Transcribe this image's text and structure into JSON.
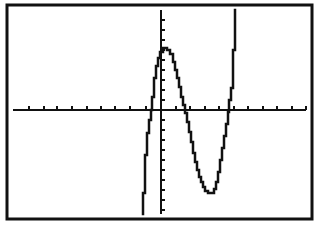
{
  "screen": {
    "background": "#ffffff",
    "ink": "#111111"
  },
  "frame": {
    "x": 7,
    "y": 5,
    "width": 305,
    "height": 214,
    "stroke_width": 3
  },
  "axes": {
    "x_axis": {
      "y": 110,
      "x_start": 13,
      "x_end": 306
    },
    "y_axis": {
      "x": 161,
      "y_start": 10,
      "y_end": 214
    },
    "x_tick_pixel_positions": [
      29,
      44,
      57,
      72,
      87,
      101,
      115,
      130,
      146,
      161,
      176,
      190,
      205,
      219,
      234,
      248,
      263,
      277,
      292,
      306
    ],
    "y_tick_pixel_positions": [
      20,
      30,
      40,
      50,
      60,
      70,
      80,
      90,
      100,
      120,
      130,
      140,
      150,
      160,
      170,
      180,
      190,
      200,
      210
    ],
    "tick_length": 4
  },
  "chart_data": {
    "type": "line",
    "title": "",
    "xlabel": "",
    "ylabel": "",
    "grid": false,
    "legend": null,
    "axis_labels_shown": false,
    "series": [
      {
        "name": "Y1",
        "style": "pixelated-step",
        "points_px": [
          [
            143,
            214
          ],
          [
            143,
            193
          ],
          [
            145,
            193
          ],
          [
            145,
            155
          ],
          [
            147,
            155
          ],
          [
            147,
            133
          ],
          [
            149,
            133
          ],
          [
            149,
            120
          ],
          [
            151,
            120
          ],
          [
            151,
            110
          ],
          [
            152,
            110
          ],
          [
            152,
            97
          ],
          [
            154,
            97
          ],
          [
            154,
            78
          ],
          [
            156,
            78
          ],
          [
            156,
            66
          ],
          [
            158,
            66
          ],
          [
            158,
            58
          ],
          [
            160,
            58
          ],
          [
            160,
            52
          ],
          [
            163,
            52
          ],
          [
            163,
            48
          ],
          [
            167,
            48
          ],
          [
            167,
            50
          ],
          [
            170,
            50
          ],
          [
            170,
            54
          ],
          [
            173,
            54
          ],
          [
            173,
            62
          ],
          [
            175,
            62
          ],
          [
            175,
            70
          ],
          [
            177,
            70
          ],
          [
            177,
            78
          ],
          [
            179,
            78
          ],
          [
            179,
            87
          ],
          [
            181,
            87
          ],
          [
            181,
            97
          ],
          [
            183,
            97
          ],
          [
            183,
            105
          ],
          [
            185,
            105
          ],
          [
            185,
            113
          ],
          [
            187,
            113
          ],
          [
            187,
            122
          ],
          [
            189,
            122
          ],
          [
            189,
            132
          ],
          [
            191,
            132
          ],
          [
            191,
            142
          ],
          [
            193,
            142
          ],
          [
            193,
            153
          ],
          [
            195,
            153
          ],
          [
            195,
            162
          ],
          [
            197,
            162
          ],
          [
            197,
            170
          ],
          [
            199,
            170
          ],
          [
            199,
            177
          ],
          [
            201,
            177
          ],
          [
            201,
            182
          ],
          [
            203,
            182
          ],
          [
            203,
            187
          ],
          [
            205,
            187
          ],
          [
            205,
            191
          ],
          [
            208,
            191
          ],
          [
            208,
            193
          ],
          [
            214,
            193
          ],
          [
            214,
            189
          ],
          [
            216,
            189
          ],
          [
            216,
            182
          ],
          [
            218,
            182
          ],
          [
            218,
            172
          ],
          [
            220,
            172
          ],
          [
            220,
            160
          ],
          [
            222,
            160
          ],
          [
            222,
            148
          ],
          [
            224,
            148
          ],
          [
            224,
            136
          ],
          [
            226,
            136
          ],
          [
            226,
            124
          ],
          [
            228,
            124
          ],
          [
            228,
            112
          ],
          [
            229,
            112
          ],
          [
            229,
            100
          ],
          [
            231,
            100
          ],
          [
            231,
            88
          ],
          [
            233,
            88
          ],
          [
            233,
            50
          ],
          [
            235,
            50
          ],
          [
            235,
            10
          ]
        ]
      }
    ]
  }
}
